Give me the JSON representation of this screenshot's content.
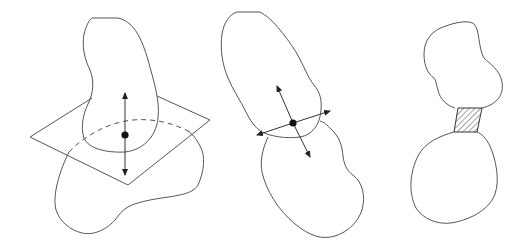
{
  "figure": {
    "panels": [
      {
        "id": "left",
        "label": "",
        "elements": [
          "upper-blob",
          "lower-blob",
          "cutting-plane",
          "dashed-intersection-curve",
          "normal-arrow",
          "contact-point"
        ]
      },
      {
        "id": "middle",
        "label": "",
        "elements": [
          "upper-blob",
          "lower-blob",
          "tangent-arrow",
          "normal-arrow",
          "contact-point"
        ]
      },
      {
        "id": "right",
        "label": "",
        "elements": [
          "upper-blob",
          "lower-blob",
          "hatched-neck"
        ]
      }
    ],
    "colors": {
      "stroke": "#555555",
      "point": "#111111",
      "background": "#ffffff"
    }
  }
}
